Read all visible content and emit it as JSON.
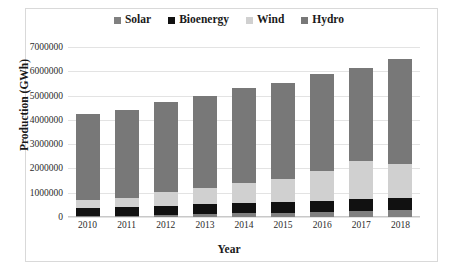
{
  "chart_data": {
    "type": "bar",
    "stacked": true,
    "title": "",
    "xlabel": "Year",
    "ylabel": "Production (GWh)",
    "categories": [
      "2010",
      "2011",
      "2012",
      "2013",
      "2014",
      "2015",
      "2016",
      "2017",
      "2018"
    ],
    "ylim": [
      0,
      7000000
    ],
    "ytick_values": [
      0,
      1000000,
      2000000,
      3000000,
      4000000,
      5000000,
      6000000,
      7000000
    ],
    "ytick_labels": [
      "0",
      "1000000",
      "2000000",
      "3000000",
      "4000000",
      "5000000",
      "6000000",
      "7000000"
    ],
    "grid": true,
    "legend_position": "top",
    "stack_order_bottom_to_top": [
      "Solar",
      "Bioenergy",
      "Wind",
      "Hydro"
    ],
    "series": [
      {
        "name": "Solar",
        "color": "#808080",
        "values": [
          40000,
          60000,
          90000,
          120000,
          150000,
          180000,
          220000,
          260000,
          300000
        ]
      },
      {
        "name": "Bioenergy",
        "color": "#111111",
        "values": [
          330000,
          340000,
          370000,
          400000,
          420000,
          430000,
          450000,
          470000,
          480000
        ]
      },
      {
        "name": "Wind",
        "color": "#d0d0d0",
        "values": [
          330000,
          400000,
          560000,
          660000,
          820000,
          950000,
          1230000,
          1570000,
          1420000
        ]
      },
      {
        "name": "Hydro",
        "color": "#787878",
        "values": [
          3550000,
          3600000,
          3730000,
          3820000,
          3910000,
          3940000,
          4000000,
          3850000,
          4300000
        ]
      }
    ],
    "totals": [
      4250000,
      4400000,
      4750000,
      5000000,
      5300000,
      5500000,
      5900000,
      6150000,
      6500000
    ]
  },
  "legend": {
    "items": [
      {
        "label": "Solar"
      },
      {
        "label": "Bioenergy"
      },
      {
        "label": "Wind"
      },
      {
        "label": "Hydro"
      }
    ]
  }
}
